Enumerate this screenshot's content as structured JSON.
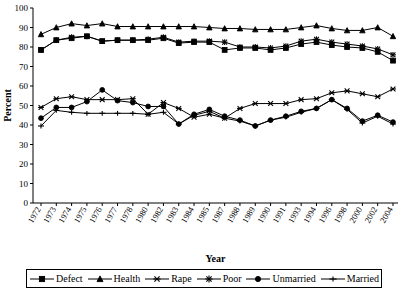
{
  "chart_data": {
    "type": "line",
    "title": "",
    "xlabel": "Year",
    "ylabel": "Percent",
    "ylim": [
      0,
      100
    ],
    "ytick_step": 10,
    "yticks": [
      0,
      10,
      20,
      30,
      40,
      50,
      60,
      70,
      80,
      90,
      100
    ],
    "grid": false,
    "legend_position": "bottom",
    "categories": [
      "1972",
      "1973",
      "1974",
      "1975",
      "1976",
      "1977",
      "1978",
      "1980",
      "1982",
      "1983",
      "1984",
      "1985",
      "1987",
      "1988",
      "1989",
      "1990",
      "1991",
      "1993",
      "1994",
      "1996",
      "1998",
      "2000",
      "2002",
      "2004"
    ],
    "series": [
      {
        "name": "Defect",
        "marker": "square",
        "values": [
          78.5,
          83.5,
          84.5,
          85.5,
          83,
          83.5,
          83.5,
          83.5,
          84.5,
          82,
          82.5,
          82.5,
          78.5,
          79.5,
          79.5,
          78.5,
          79.5,
          81.5,
          82.5,
          81,
          80,
          79.5,
          77.5,
          73
        ]
      },
      {
        "name": "Health",
        "marker": "triangle",
        "values": [
          86.5,
          90,
          92,
          91,
          92,
          90.5,
          90.5,
          90.5,
          90.5,
          90.5,
          90.5,
          90,
          89.5,
          89.5,
          89,
          89,
          89,
          90,
          91,
          89.5,
          88.5,
          88.5,
          90,
          85.5
        ]
      },
      {
        "name": "Rape",
        "marker": "cross",
        "values": [
          49,
          53.5,
          54.5,
          53,
          53,
          53,
          53.5,
          45.5,
          51.5,
          48.5,
          44,
          45.5,
          43.5,
          48.5,
          51,
          51,
          51,
          53,
          53.5,
          56.5,
          57.5,
          56,
          54.5,
          58.5
        ]
      },
      {
        "name": "Poor",
        "marker": "star",
        "values": [
          78.5,
          83.5,
          85,
          85.5,
          83,
          83.5,
          83.5,
          84,
          85,
          82.5,
          83,
          83,
          82.5,
          80,
          80,
          79.5,
          80.5,
          83,
          84,
          82.5,
          81.5,
          80.5,
          79,
          76
        ]
      },
      {
        "name": "Unmarried",
        "marker": "circle",
        "values": [
          43.5,
          49,
          49,
          52,
          58,
          52.5,
          51.5,
          49.5,
          49.5,
          40.5,
          45.5,
          48,
          44.5,
          42.5,
          39.5,
          42.5,
          44.5,
          47,
          48.5,
          53,
          48.5,
          42,
          45,
          41.5
        ]
      },
      {
        "name": "Married",
        "marker": "plus",
        "values": [
          39.5,
          47.5,
          46.5,
          46,
          46,
          46,
          46,
          45.5,
          46.5,
          40.5,
          45,
          47,
          43.5,
          42,
          39.5,
          42.5,
          44,
          46.5,
          48.5,
          53,
          48,
          41,
          44.5,
          40.5
        ]
      }
    ]
  },
  "legend": {
    "items": [
      {
        "label": "Defect",
        "marker": "square"
      },
      {
        "label": "Health",
        "marker": "triangle"
      },
      {
        "label": "Rape",
        "marker": "cross"
      },
      {
        "label": "Poor",
        "marker": "star"
      },
      {
        "label": "Unmarried",
        "marker": "circle"
      },
      {
        "label": "Married",
        "marker": "plus"
      }
    ]
  },
  "colors": {
    "ink": "#000000",
    "background": "#ffffff"
  }
}
